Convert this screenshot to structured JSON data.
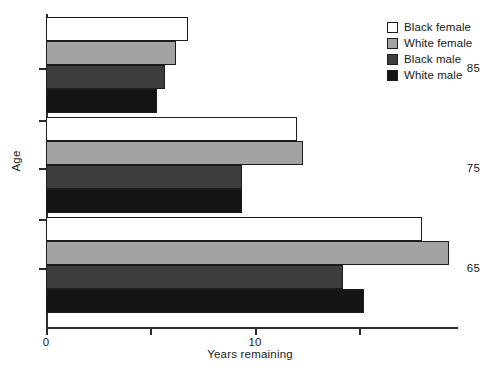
{
  "chart_data": {
    "type": "bar",
    "orientation": "horizontal",
    "title": "",
    "xlabel": "Years remaining",
    "ylabel": "Age",
    "categories": [
      "85",
      "75",
      "65"
    ],
    "xlim": [
      0,
      19.7
    ],
    "xticks": [
      0,
      10
    ],
    "xtick_labels": [
      "0",
      "10"
    ],
    "xminor_ticks": [
      5,
      15
    ],
    "grid": false,
    "legend_position": "top-right",
    "series": [
      {
        "name": "Black female",
        "color": "#ffffff",
        "values": [
          6.8,
          12.0,
          18.0
        ]
      },
      {
        "name": "White female",
        "color": "#a3a3a3",
        "values": [
          6.2,
          12.3,
          19.3
        ]
      },
      {
        "name": "Black male",
        "color": "#3d3d3d",
        "values": [
          5.7,
          9.4,
          14.2
        ]
      },
      {
        "name": "White male",
        "color": "#141414",
        "values": [
          5.3,
          9.4,
          15.2
        ]
      }
    ]
  },
  "legend": {
    "items": [
      {
        "label": "Black female",
        "color": "#ffffff"
      },
      {
        "label": "White female",
        "color": "#a3a3a3"
      },
      {
        "label": "Black male",
        "color": "#3d3d3d"
      },
      {
        "label": "White male",
        "color": "#141414"
      }
    ]
  },
  "axes": {
    "y_title": "Age",
    "x_title": "Years remaining",
    "y_labels": [
      "85",
      "75",
      "65"
    ],
    "x_labels": [
      "0",
      "10"
    ]
  }
}
